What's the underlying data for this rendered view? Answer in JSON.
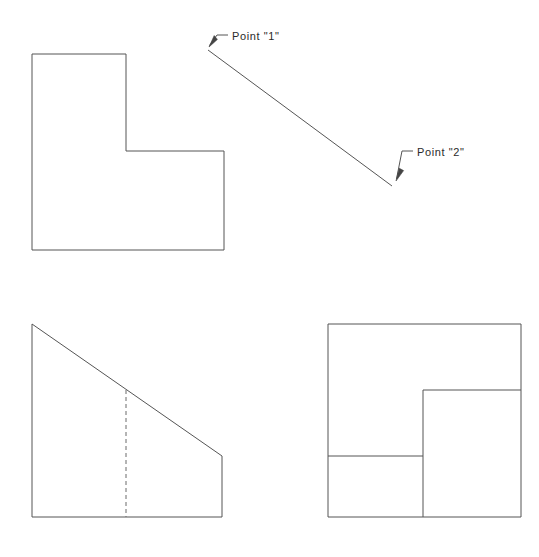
{
  "drawing": {
    "title": "Orthographic projection with pictorial view",
    "background_color": "#ffffff",
    "line_color": "#555555",
    "text_color": "#2b2b2b",
    "canvas": {
      "width": 539,
      "height": 557
    }
  },
  "annotations": {
    "point_one": {
      "label": "Point  \"1\"",
      "text_x": 232,
      "text_y": 40,
      "leader_elbow": [
        228,
        35
      ],
      "leader_bend": [
        217,
        35
      ],
      "arrow_tip": [
        209,
        46
      ]
    },
    "point_two": {
      "label": "Point  \"2\"",
      "text_x": 417,
      "text_y": 156,
      "leader_elbow": [
        413,
        151
      ],
      "leader_bend": [
        402,
        151
      ],
      "arrow_tip": [
        396,
        180
      ]
    }
  },
  "views": {
    "top_view": {
      "name": "Top view (L-shaped outline)",
      "outline": "32,54 126,54 126,151 224,151 224,250 32,250"
    },
    "pictorial_edge": {
      "name": "Isometric edge line from Point 1 to Point 2",
      "start": [
        208,
        50
      ],
      "end": [
        392,
        186
      ]
    },
    "front_view": {
      "name": "Front view (trapezoid with hidden line)",
      "outline": "32,324 222,456 222,517 32,517",
      "hidden_line": {
        "x": 126,
        "y_top": 390,
        "y_bottom": 517,
        "style": "dashed"
      }
    },
    "side_view": {
      "name": "Side view (square with internal edges)",
      "outline": "328,324 521,324 521,517 328,517",
      "internal_vertical": {
        "x": 423,
        "y_top": 390,
        "y_bottom": 517
      },
      "internal_horizontal_upper": {
        "y": 390,
        "x_left": 423,
        "x_right": 521
      },
      "internal_horizontal_lower": {
        "y": 456,
        "x_left": 328,
        "x_right": 423
      }
    }
  }
}
